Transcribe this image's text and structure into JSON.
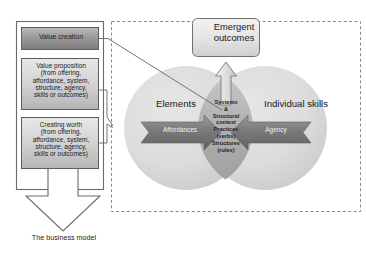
{
  "figure": {
    "caption": "The business model"
  },
  "left_panel": {
    "name": "business-model-stack",
    "boxes": [
      {
        "id": "value-creation",
        "label": "Value creation"
      },
      {
        "id": "value-proposition",
        "label": "Value proposition\n(from offering,\naffordance, system,\nstructure, agency,\nskills or outcomes)"
      },
      {
        "id": "creating-worth",
        "label": "Creating worth\n(from offering,\naffordance, system,\nstructure, agency,\nskills or outcomes)"
      }
    ]
  },
  "right_panel": {
    "name": "value-co-creation-model",
    "emergent_outcomes": "Emergent\noutcomes",
    "circles": [
      {
        "id": "elements",
        "label": "Elements"
      },
      {
        "id": "individual-skills",
        "label": "Individual skills"
      }
    ],
    "intersection": {
      "id": "systems-structural-context",
      "label": "Systems\n&\nStructural\ncontext\nPractices\n(verbs)\nStructures\n(rules)"
    },
    "arrows": [
      {
        "id": "affordances",
        "label": "Affordances",
        "direction": "right"
      },
      {
        "id": "agency",
        "label": "Agency",
        "direction": "left"
      }
    ]
  },
  "colors": {
    "box_fill_light": "#d8d8d8",
    "box_fill_dark": "#8f8f8f",
    "circle_fill": "#d9d9d9",
    "lens_fill": "#b4b4b4",
    "arrow_dark": "#6f6f6f",
    "outline": "#6b6b6b",
    "dashed_border": "#8a8a8a",
    "text": "#1d1d1d"
  }
}
